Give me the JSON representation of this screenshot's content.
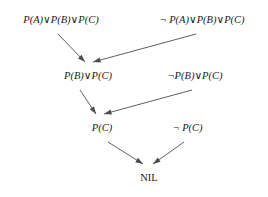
{
  "diagram": {
    "background_color": "#ffffff",
    "box_border_color": "#5a5a5a",
    "edge_color": "#4d4d4d",
    "text_color": "#1a1a1a",
    "nodes": [
      {
        "id": "c1",
        "label": "P(A)∨P(B)∨P(C)",
        "x": 5,
        "y": 7,
        "w": 112,
        "h": 26,
        "font_size": 10.5,
        "style": "italic"
      },
      {
        "id": "c2",
        "label": "¬ P(A)∨P(B)∨P(C)",
        "x": 142,
        "y": 7,
        "w": 120,
        "h": 26,
        "font_size": 10.5,
        "style": "italic"
      },
      {
        "id": "c3",
        "label": "P(B)∨P(C)",
        "x": 49,
        "y": 63,
        "w": 78,
        "h": 26,
        "font_size": 10.5,
        "style": "italic"
      },
      {
        "id": "c4",
        "label": "¬P(B)∨P(C)",
        "x": 153,
        "y": 63,
        "w": 84,
        "h": 26,
        "font_size": 10.5,
        "style": "italic"
      },
      {
        "id": "c5",
        "label": "P(C)",
        "x": 82,
        "y": 116,
        "w": 40,
        "h": 25,
        "font_size": 10.5,
        "style": "italic"
      },
      {
        "id": "c6",
        "label": "¬ P(C)",
        "x": 165,
        "y": 116,
        "w": 45,
        "h": 25,
        "font_size": 10.5,
        "style": "italic"
      },
      {
        "id": "c7",
        "label": "NIL",
        "x": 134,
        "y": 166,
        "w": 30,
        "h": 24,
        "font_size": 10.5,
        "style": "plain"
      }
    ],
    "edges": [
      {
        "from": "c1",
        "to": "c3",
        "x1": 58,
        "y1": 34,
        "x2": 85,
        "y2": 62
      },
      {
        "from": "c2",
        "to": "c3",
        "x1": 196,
        "y1": 34,
        "x2": 93,
        "y2": 62
      },
      {
        "from": "c3",
        "to": "c5",
        "x1": 80,
        "y1": 90,
        "x2": 96,
        "y2": 114
      },
      {
        "from": "c4",
        "to": "c5",
        "x1": 192,
        "y1": 90,
        "x2": 104,
        "y2": 114
      },
      {
        "from": "c5",
        "to": "c7",
        "x1": 108,
        "y1": 142,
        "x2": 143,
        "y2": 164
      },
      {
        "from": "c6",
        "to": "c7",
        "x1": 184,
        "y1": 142,
        "x2": 153,
        "y2": 164
      }
    ]
  }
}
